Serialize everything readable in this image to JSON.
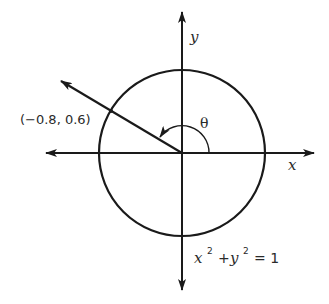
{
  "diagram": {
    "type": "unit-circle",
    "labels": {
      "x_axis": "x",
      "y_axis": "y",
      "angle": "θ",
      "point": "(−0.8, 0.6)",
      "equation_x": "x",
      "equation_plus": "+",
      "equation_y": "y",
      "equation_exp": "2",
      "equation_rhs": "= 1"
    },
    "point": {
      "x": -0.8,
      "y": 0.6
    },
    "colors": {
      "stroke": "#1a1a1a",
      "text": "#2a2a2a",
      "background": "#ffffff"
    }
  }
}
